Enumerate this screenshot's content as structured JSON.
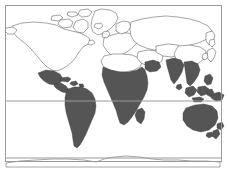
{
  "map": {
    "title": "World Map with Shaded Regions",
    "projection": "equirectangular",
    "background_color": "#ffffff",
    "frame": {
      "color": "#9a9a9a",
      "stroke_width": 1,
      "x": 5,
      "y": 5,
      "width": 217,
      "height": 157
    },
    "coastline": {
      "color": "#4a4a4a",
      "stroke_width": 0.5
    },
    "shading": {
      "fill_color": "#555555",
      "legend_meaning": "shaded region",
      "unshaded_fill": "#ffffff"
    },
    "graticule": {
      "color": "#9a9a9a",
      "stroke_width": 1,
      "horizontal_lines": [
        {
          "name": "equator",
          "y": 101
        },
        {
          "name": "southern-parallel",
          "y": 158
        }
      ],
      "vertical_lines": []
    },
    "shaded_regions": [
      "Mexico",
      "Central America",
      "Caribbean",
      "South America",
      "Sub-Saharan Africa",
      "Madagascar",
      "Arabian Peninsula south",
      "India",
      "Southeast Asia",
      "Indonesia",
      "Philippines",
      "Papua New Guinea",
      "Australia",
      "New Zealand"
    ],
    "unshaded_regions": [
      "Canada",
      "United States",
      "Greenland",
      "Europe",
      "Russia",
      "North Africa",
      "China",
      "Japan",
      "Korea",
      "Antarctica"
    ]
  }
}
